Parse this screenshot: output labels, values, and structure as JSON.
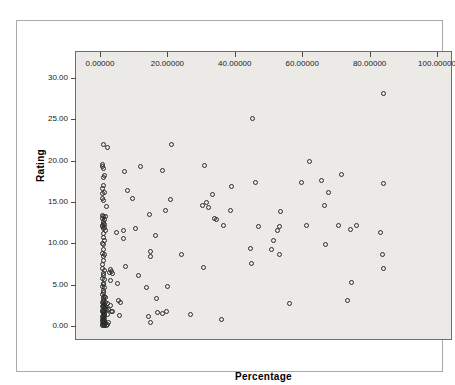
{
  "chart_data": {
    "type": "scatter",
    "title": "",
    "xlabel": "Percentage",
    "ylabel": "Rating",
    "xlim": [
      0,
      100
    ],
    "ylim": [
      0,
      30
    ],
    "grid": false,
    "legend": null,
    "marker": "open-circle",
    "marker_color": "#2b2b2b",
    "plot_background": "#eceae7",
    "xticks": [
      "0.00000",
      "20.00000",
      "40.00000",
      "60.00000",
      "80.00000",
      "100.00000"
    ],
    "xtick_values": [
      0,
      20,
      40,
      60,
      80,
      100
    ],
    "yticks": [
      "0.00",
      "5.00",
      "10.00",
      "15.00",
      "20.00",
      "25.00",
      "30.00"
    ],
    "ytick_values": [
      0,
      5,
      10,
      15,
      20,
      25,
      30
    ],
    "points": [
      [
        84.2,
        28.1
      ],
      [
        45.3,
        25.1
      ],
      [
        0.9,
        22.0
      ],
      [
        21.3,
        21.9
      ],
      [
        2.2,
        21.6
      ],
      [
        62.3,
        19.9
      ],
      [
        31.0,
        19.4
      ],
      [
        0.6,
        19.5
      ],
      [
        0.8,
        19.3
      ],
      [
        1.0,
        19.0
      ],
      [
        12.1,
        19.3
      ],
      [
        7.2,
        18.7
      ],
      [
        18.6,
        18.8
      ],
      [
        1.4,
        18.2
      ],
      [
        71.8,
        18.3
      ],
      [
        0.9,
        18.0
      ],
      [
        65.6,
        17.6
      ],
      [
        46.2,
        17.3
      ],
      [
        59.7,
        17.3
      ],
      [
        39.0,
        16.9
      ],
      [
        84.0,
        17.2
      ],
      [
        1.1,
        17.0
      ],
      [
        0.8,
        16.6
      ],
      [
        1.3,
        16.1
      ],
      [
        0.7,
        16.0
      ],
      [
        8.2,
        16.4
      ],
      [
        33.5,
        15.9
      ],
      [
        67.8,
        16.2
      ],
      [
        0.7,
        15.4
      ],
      [
        9.5,
        15.4
      ],
      [
        21.0,
        15.3
      ],
      [
        1.1,
        15.2
      ],
      [
        31.7,
        15.0
      ],
      [
        66.5,
        14.6
      ],
      [
        30.3,
        14.6
      ],
      [
        32.3,
        14.3
      ],
      [
        38.8,
        14.0
      ],
      [
        53.6,
        13.9
      ],
      [
        2.0,
        14.4
      ],
      [
        19.3,
        14.0
      ],
      [
        0.8,
        13.4
      ],
      [
        1.1,
        13.3
      ],
      [
        1.6,
        13.2
      ],
      [
        0.6,
        13.0
      ],
      [
        14.7,
        13.5
      ],
      [
        34.0,
        13.0
      ],
      [
        34.5,
        12.9
      ],
      [
        1.0,
        12.6
      ],
      [
        0.9,
        12.4
      ],
      [
        1.4,
        12.3
      ],
      [
        36.6,
        12.2
      ],
      [
        61.2,
        12.1
      ],
      [
        47.0,
        12.0
      ],
      [
        0.8,
        12.0
      ],
      [
        1.3,
        11.9
      ],
      [
        10.4,
        11.8
      ],
      [
        53.2,
        12.0
      ],
      [
        52.8,
        11.6
      ],
      [
        70.8,
        12.2
      ],
      [
        76.2,
        12.2
      ],
      [
        5.0,
        11.3
      ],
      [
        7.0,
        11.6
      ],
      [
        74.4,
        11.7
      ],
      [
        83.3,
        11.3
      ],
      [
        16.5,
        10.9
      ],
      [
        6.9,
        10.6
      ],
      [
        0.9,
        10.7
      ],
      [
        1.2,
        10.4
      ],
      [
        51.6,
        10.4
      ],
      [
        67.0,
        9.9
      ],
      [
        0.8,
        10.0
      ],
      [
        1.0,
        9.8
      ],
      [
        44.6,
        9.4
      ],
      [
        0.9,
        9.2
      ],
      [
        50.8,
        9.2
      ],
      [
        0.7,
        8.8
      ],
      [
        1.3,
        8.7
      ],
      [
        53.2,
        8.7
      ],
      [
        14.9,
        8.4
      ],
      [
        24.3,
        8.6
      ],
      [
        83.9,
        8.6
      ],
      [
        15.0,
        9.0
      ],
      [
        0.9,
        8.4
      ],
      [
        1.0,
        7.9
      ],
      [
        45.0,
        7.6
      ],
      [
        30.8,
        7.1
      ],
      [
        7.5,
        7.2
      ],
      [
        84.2,
        6.9
      ],
      [
        0.8,
        6.9
      ],
      [
        1.2,
        6.7
      ],
      [
        3.4,
        6.6
      ],
      [
        3.6,
        6.3
      ],
      [
        0.9,
        6.4
      ],
      [
        1.1,
        6.1
      ],
      [
        11.3,
        6.1
      ],
      [
        0.7,
        5.8
      ],
      [
        1.4,
        5.6
      ],
      [
        3.2,
        5.5
      ],
      [
        74.7,
        5.3
      ],
      [
        0.9,
        5.2
      ],
      [
        1.1,
        5.0
      ],
      [
        5.2,
        5.1
      ],
      [
        0.8,
        4.8
      ],
      [
        1.3,
        4.6
      ],
      [
        19.9,
        4.8
      ],
      [
        13.9,
        4.7
      ],
      [
        1.0,
        4.3
      ],
      [
        0.9,
        4.1
      ],
      [
        0.7,
        3.8
      ],
      [
        1.2,
        3.6
      ],
      [
        16.8,
        3.3
      ],
      [
        73.5,
        3.1
      ],
      [
        0.9,
        3.2
      ],
      [
        1.1,
        3.0
      ],
      [
        1.5,
        2.9
      ],
      [
        5.4,
        3.1
      ],
      [
        6.0,
        2.9
      ],
      [
        0.8,
        2.8
      ],
      [
        1.0,
        2.7
      ],
      [
        1.3,
        2.6
      ],
      [
        2.3,
        2.7
      ],
      [
        3.0,
        2.5
      ],
      [
        56.3,
        2.7
      ],
      [
        0.7,
        2.4
      ],
      [
        0.9,
        2.3
      ],
      [
        1.2,
        2.2
      ],
      [
        1.6,
        2.1
      ],
      [
        2.0,
        2.0
      ],
      [
        0.8,
        1.9
      ],
      [
        1.1,
        1.8
      ],
      [
        1.4,
        1.8
      ],
      [
        3.3,
        1.8
      ],
      [
        3.7,
        1.7
      ],
      [
        0.9,
        1.6
      ],
      [
        1.0,
        1.5
      ],
      [
        1.3,
        1.4
      ],
      [
        5.8,
        1.3
      ],
      [
        14.4,
        1.2
      ],
      [
        18.4,
        1.5
      ],
      [
        19.6,
        1.8
      ],
      [
        27.0,
        1.4
      ],
      [
        17.0,
        1.6
      ],
      [
        36.0,
        0.8
      ],
      [
        0.7,
        1.2
      ],
      [
        0.9,
        1.1
      ],
      [
        1.1,
        1.0
      ],
      [
        1.4,
        0.9
      ],
      [
        0.8,
        0.8
      ],
      [
        1.0,
        0.7
      ],
      [
        1.2,
        0.6
      ],
      [
        0.6,
        0.5
      ],
      [
        0.9,
        0.4
      ],
      [
        1.1,
        0.3
      ],
      [
        1.5,
        0.3
      ],
      [
        0.7,
        0.2
      ],
      [
        1.0,
        0.15
      ],
      [
        1.3,
        0.1
      ],
      [
        1.8,
        0.1
      ],
      [
        2.2,
        0.2
      ],
      [
        0.8,
        0.05
      ],
      [
        1.2,
        0.05
      ],
      [
        2.6,
        0.4
      ],
      [
        14.9,
        0.4
      ],
      [
        0.9,
        3.5
      ],
      [
        1.5,
        3.4
      ],
      [
        0.7,
        7.4
      ],
      [
        1.0,
        11.2
      ],
      [
        1.3,
        12.9
      ],
      [
        0.8,
        12.1
      ],
      [
        1.6,
        11.5
      ],
      [
        0.9,
        11.8
      ],
      [
        2.8,
        6.5
      ],
      [
        3.1,
        6.8
      ],
      [
        1.1,
        2.45
      ],
      [
        1.7,
        2.35
      ],
      [
        2.1,
        1.45
      ],
      [
        0.95,
        0.9
      ],
      [
        1.25,
        1.25
      ],
      [
        1.45,
        0.55
      ],
      [
        0.65,
        1.75
      ],
      [
        2.4,
        1.95
      ]
    ]
  },
  "axes": {
    "x_title": "Percentage",
    "y_title": "Rating"
  }
}
